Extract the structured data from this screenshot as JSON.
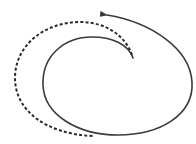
{
  "diagram": {
    "type": "spiral-arrow",
    "background": "#ffffff",
    "stroke_color": "#3a3a3a",
    "solid_path": {
      "style": "solid",
      "description": "Spiral from arrowhead at top, clockwise around right/bottom/left, ending near center",
      "arrowhead": "start-top-left"
    },
    "dashed_path": {
      "style": "dashed",
      "description": "Outer dashed arc on the left side from center-top down to bottom"
    }
  }
}
